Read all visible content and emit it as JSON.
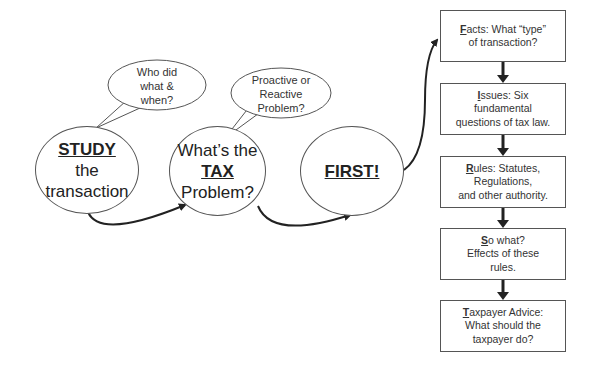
{
  "bubbles": [
    {
      "lines": [
        "Who did",
        "what &",
        "when?"
      ]
    },
    {
      "lines": [
        "Proactive or",
        "Reactive",
        "Problem?"
      ]
    }
  ],
  "circles": [
    {
      "bold": "STUDY",
      "lines": [
        "the",
        "transaction"
      ]
    },
    {
      "pre": "What’s the",
      "bold": "TAX",
      "post": "Problem?"
    },
    {
      "bold": "FIRST!"
    }
  ],
  "boxes": [
    {
      "letter": "F",
      "rest": "acts:  What “type”",
      "line2": "of transaction?",
      "line3": ""
    },
    {
      "letter": "I",
      "rest": "ssues: Six",
      "line2": "fundamental",
      "line3": "questions of tax law."
    },
    {
      "letter": "R",
      "rest": "ules:  Statutes,",
      "line2": "Regulations,",
      "line3": "and other authority."
    },
    {
      "letter": "S",
      "rest": "o what?",
      "line2": "Effects of these",
      "line3": "rules."
    },
    {
      "letter": "T",
      "rest": "axpayer Advice:",
      "line2": "What should the",
      "line3": "taxpayer do?"
    }
  ],
  "colors": {
    "stroke": "#555555",
    "arrow": "#222222",
    "text": "#222222"
  }
}
